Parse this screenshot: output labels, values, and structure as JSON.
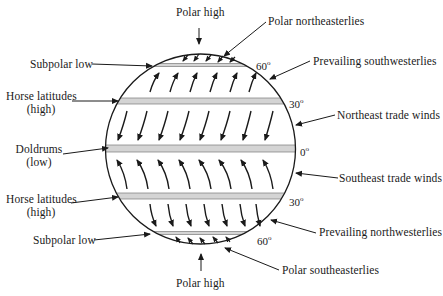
{
  "diagram": {
    "top_label": "Polar high",
    "bottom_label": "Polar high",
    "left_labels": {
      "subpolar_low_north": "Subpolar low",
      "horse_latitudes_north_line1": "Horse latitudes",
      "horse_latitudes_north_line2": "(high)",
      "doldrums_line1": "Doldrums",
      "doldrums_line2": "(low)",
      "horse_latitudes_south_line1": "Horse latitudes",
      "horse_latitudes_south_line2": "(high)",
      "subpolar_low_south": "Subpolar low"
    },
    "right_labels": {
      "polar_northeasterlies": "Polar northeasterlies",
      "prevailing_southwesterlies": "Prevailing southwesterlies",
      "northeast_trade_winds": "Northeast trade winds",
      "southeast_trade_winds": "Southeast trade winds",
      "prevailing_northwesterlies": "Prevailing northwesterlies",
      "polar_southeasterlies": "Polar southeasterlies"
    },
    "latitude_labels": {
      "n60": "60",
      "n30": "30",
      "eq": "0",
      "s30": "30",
      "s60": "60",
      "degree_symbol": "o"
    },
    "bands": [
      {
        "name": "60N",
        "y": 64,
        "height": 3
      },
      {
        "name": "30N",
        "y": 98,
        "height": 6
      },
      {
        "name": "equator",
        "y": 145,
        "height": 7
      },
      {
        "name": "30S",
        "y": 193,
        "height": 6
      },
      {
        "name": "60S",
        "y": 232,
        "height": 3
      }
    ],
    "wind_belts": [
      {
        "name": "Polar northeasterlies",
        "region": "60N-90N",
        "direction": "down-left (toward SW)"
      },
      {
        "name": "Prevailing southwesterlies",
        "region": "30N-60N",
        "direction": "up-right (toward NE)"
      },
      {
        "name": "Northeast trade winds",
        "region": "0-30N",
        "direction": "down-left (toward SW)"
      },
      {
        "name": "Southeast trade winds",
        "region": "0-30S",
        "direction": "up-left (toward NW)"
      },
      {
        "name": "Prevailing northwesterlies",
        "region": "30S-60S",
        "direction": "down-right (toward SE)"
      },
      {
        "name": "Polar southeasterlies",
        "region": "60S-90S",
        "direction": "up-left (toward NW)"
      }
    ],
    "colors": {
      "line": "#1a1a1a",
      "band_fill": "#d4d4d4",
      "band_edge": "#7a7a7a",
      "background": "#ffffff"
    }
  }
}
